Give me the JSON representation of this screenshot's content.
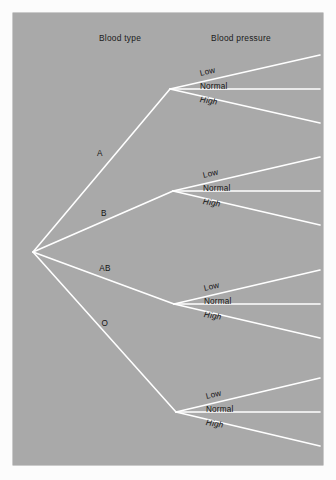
{
  "diagram": {
    "title_columns": {
      "blood_type": "Blood type",
      "blood_pressure": "Blood pressure"
    },
    "colors": {
      "panel_background": "#a9a9a9",
      "branch_line": "#ffffff",
      "label_text": "#141414",
      "page_background": "#fcfcfc"
    },
    "root": {
      "x": 33,
      "y": 252
    },
    "blood_types": [
      {
        "label": "A",
        "label_x": 100,
        "label_y": 153,
        "node_x": 170,
        "node_y": 89
      },
      {
        "label": "B",
        "label_x": 104,
        "label_y": 213,
        "node_x": 173,
        "node_y": 191
      },
      {
        "label": "AB",
        "label_x": 105,
        "label_y": 268,
        "node_x": 174,
        "node_y": 304
      },
      {
        "label": "O",
        "label_x": 105,
        "label_y": 323,
        "node_x": 176,
        "node_y": 412
      }
    ],
    "blood_pressures": [
      "Low",
      "Normal",
      "High"
    ],
    "groups": [
      {
        "type": "A",
        "node_x": 170,
        "node_y": 89,
        "branches": [
          {
            "label": "Low",
            "end_x": 320,
            "end_y": 55,
            "label_x": 200,
            "label_y": 69
          },
          {
            "label": "Normal",
            "end_x": 320,
            "end_y": 89,
            "label_x": 200,
            "label_y": 82
          },
          {
            "label": "High",
            "end_x": 320,
            "end_y": 123,
            "label_x": 200,
            "label_y": 95
          }
        ]
      },
      {
        "type": "B",
        "node_x": 173,
        "node_y": 191,
        "branches": [
          {
            "label": "Low",
            "end_x": 320,
            "end_y": 157,
            "label_x": 203,
            "label_y": 171
          },
          {
            "label": "Normal",
            "end_x": 320,
            "end_y": 191,
            "label_x": 203,
            "label_y": 184
          },
          {
            "label": "High",
            "end_x": 320,
            "end_y": 225,
            "label_x": 203,
            "label_y": 197
          }
        ]
      },
      {
        "type": "AB",
        "node_x": 174,
        "node_y": 304,
        "branches": [
          {
            "label": "Low",
            "end_x": 320,
            "end_y": 270,
            "label_x": 204,
            "label_y": 284
          },
          {
            "label": "Normal",
            "end_x": 320,
            "end_y": 304,
            "label_x": 204,
            "label_y": 297
          },
          {
            "label": "High",
            "end_x": 320,
            "end_y": 338,
            "label_x": 204,
            "label_y": 310
          }
        ]
      },
      {
        "type": "O",
        "node_x": 176,
        "node_y": 412,
        "branches": [
          {
            "label": "Low",
            "end_x": 320,
            "end_y": 378,
            "label_x": 206,
            "label_y": 392
          },
          {
            "label": "Normal",
            "end_x": 320,
            "end_y": 412,
            "label_x": 206,
            "label_y": 405
          },
          {
            "label": "High",
            "end_x": 320,
            "end_y": 446,
            "label_x": 206,
            "label_y": 418
          }
        ]
      }
    ]
  }
}
